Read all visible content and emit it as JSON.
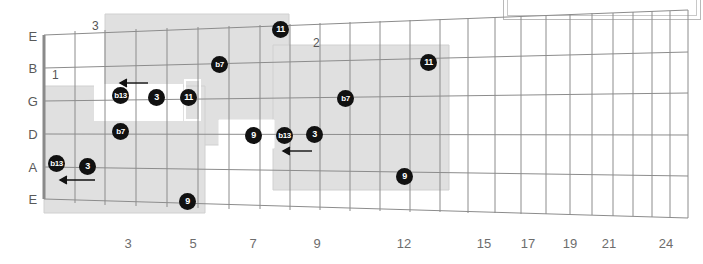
{
  "diagram": {
    "type": "guitar-fretboard",
    "title_box": {
      "present": true,
      "text": ""
    },
    "string_labels": [
      "E",
      "B",
      "G",
      "D",
      "A",
      "E"
    ],
    "fret_numbers": [
      {
        "label": "3",
        "x": 128
      },
      {
        "label": "5",
        "x": 193
      },
      {
        "label": "7",
        "x": 253
      },
      {
        "label": "9",
        "x": 317
      },
      {
        "label": "12",
        "x": 404
      },
      {
        "label": "15",
        "x": 484
      },
      {
        "label": "17",
        "x": 528
      },
      {
        "label": "19",
        "x": 570
      },
      {
        "label": "21",
        "x": 609
      },
      {
        "label": "24",
        "x": 666
      }
    ],
    "position_boxes": [
      {
        "number": "1",
        "label_x": 52,
        "label_y": 68
      },
      {
        "number": "3",
        "label_x": 92,
        "label_y": 19
      },
      {
        "number": "2",
        "label_x": 313,
        "label_y": 36
      }
    ],
    "markers": [
      {
        "degree": "b13",
        "x": 56,
        "y": 163,
        "small": true
      },
      {
        "degree": "3",
        "x": 87,
        "y": 166,
        "small": false
      },
      {
        "degree": "b7",
        "x": 120,
        "y": 131,
        "small": true
      },
      {
        "degree": "b13",
        "x": 120,
        "y": 95,
        "small": true
      },
      {
        "degree": "3",
        "x": 156,
        "y": 97,
        "small": false
      },
      {
        "degree": "11",
        "x": 188,
        "y": 97,
        "small": false
      },
      {
        "degree": "9",
        "x": 187,
        "y": 201,
        "small": false
      },
      {
        "degree": "b7",
        "x": 219,
        "y": 64,
        "small": true
      },
      {
        "degree": "11",
        "x": 280,
        "y": 29,
        "small": false
      },
      {
        "degree": "9",
        "x": 253,
        "y": 135,
        "small": false
      },
      {
        "degree": "b13",
        "x": 284,
        "y": 135,
        "small": true
      },
      {
        "degree": "3",
        "x": 314,
        "y": 134,
        "small": false
      },
      {
        "degree": "b7",
        "x": 345,
        "y": 98,
        "small": true
      },
      {
        "degree": "9",
        "x": 404,
        "y": 176,
        "small": false
      },
      {
        "degree": "11",
        "x": 428,
        "y": 62,
        "small": false
      }
    ],
    "shift_arrows": [
      {
        "x1": 95,
        "x2": 60,
        "y": 180
      },
      {
        "x1": 148,
        "x2": 120,
        "y": 83
      },
      {
        "x1": 312,
        "x2": 283,
        "y": 151
      }
    ]
  },
  "colors": {
    "marker_fill": "#111111",
    "marker_text": "#ffffff",
    "grid_line": "#8c8c8c",
    "shade": "#e0e0e0",
    "text": "#5a5a5a",
    "background": "#ffffff"
  }
}
